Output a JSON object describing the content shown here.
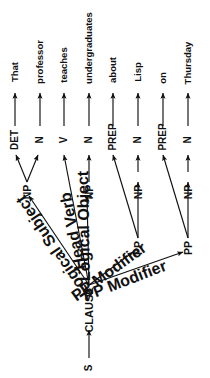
{
  "diagram": {
    "orientation": "rotated-90-ccw",
    "stroke_color": "#111111",
    "background_color": "#ffffff",
    "sentence": "That professor teaches undergraduates about Lisp on Thursday",
    "root": {
      "label": "S"
    },
    "clause": {
      "label": "CLAUSE"
    },
    "words": [
      {
        "label": "That"
      },
      {
        "label": "professor"
      },
      {
        "label": "teaches"
      },
      {
        "label": "undergraduates"
      },
      {
        "label": "about"
      },
      {
        "label": "Lisp"
      },
      {
        "label": "on"
      },
      {
        "label": "Thursday"
      }
    ],
    "pos_tags": [
      {
        "label": "DET"
      },
      {
        "label": "N"
      },
      {
        "label": "V"
      },
      {
        "label": "N"
      },
      {
        "label": "PREP"
      },
      {
        "label": "N"
      },
      {
        "label": "PREP"
      },
      {
        "label": "N"
      }
    ],
    "phrases": [
      {
        "label": "NP"
      },
      {
        "label": "NP"
      },
      {
        "label": "NP"
      },
      {
        "label": "NP"
      }
    ],
    "pp_nodes": [
      {
        "label": "PP"
      },
      {
        "label": "PP"
      }
    ],
    "edge_labels": [
      {
        "label": "Logical Subject"
      },
      {
        "label": "Head Verb"
      },
      {
        "label": "Logical Object"
      },
      {
        "label": "PP Modifier"
      },
      {
        "label": "PP Modifier"
      }
    ]
  }
}
